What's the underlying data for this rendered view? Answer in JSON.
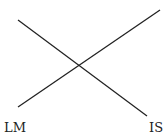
{
  "diagram": {
    "type": "IS-LM crossing curves",
    "curves": [
      {
        "name": "LM",
        "label": "LM",
        "x1": 18,
        "y1": 107,
        "x2": 160,
        "y2": 10
      },
      {
        "name": "IS",
        "label": "IS",
        "x1": 18,
        "y1": 20,
        "x2": 147,
        "y2": 116
      }
    ],
    "labels": {
      "lm": "LM",
      "is": "IS"
    },
    "line_color": "#222222"
  }
}
